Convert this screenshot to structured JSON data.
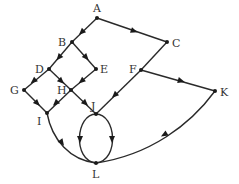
{
  "diagram": {
    "type": "directed-graph",
    "nodes": [
      {
        "id": "A",
        "label": "A",
        "x": 97,
        "y": 18,
        "lx": 93,
        "ly": 12
      },
      {
        "id": "B",
        "label": "B",
        "x": 72,
        "y": 42,
        "lx": 58,
        "ly": 46
      },
      {
        "id": "C",
        "label": "C",
        "x": 167,
        "y": 42,
        "lx": 172,
        "ly": 47
      },
      {
        "id": "D",
        "label": "D",
        "x": 49,
        "y": 69,
        "lx": 35,
        "ly": 73
      },
      {
        "id": "E",
        "label": "E",
        "x": 96,
        "y": 69,
        "lx": 100,
        "ly": 73
      },
      {
        "id": "F",
        "label": "F",
        "x": 141,
        "y": 70,
        "lx": 129,
        "ly": 73
      },
      {
        "id": "G",
        "label": "G",
        "x": 24,
        "y": 90,
        "lx": 10,
        "ly": 94
      },
      {
        "id": "H",
        "label": "H",
        "x": 71,
        "y": 90,
        "lx": 57,
        "ly": 94
      },
      {
        "id": "I",
        "label": "I",
        "x": 47,
        "y": 113,
        "lx": 37,
        "ly": 125
      },
      {
        "id": "J",
        "label": "J",
        "x": 96,
        "y": 114,
        "lx": 91,
        "ly": 110
      },
      {
        "id": "K",
        "label": "K",
        "x": 215,
        "y": 91,
        "lx": 220,
        "ly": 96
      },
      {
        "id": "L",
        "label": "L",
        "x": 96,
        "y": 163,
        "lx": 92,
        "ly": 178
      }
    ],
    "edges": [
      {
        "from": "A",
        "to": "B"
      },
      {
        "from": "A",
        "to": "C"
      },
      {
        "from": "B",
        "to": "D"
      },
      {
        "from": "B",
        "to": "E"
      },
      {
        "from": "D",
        "to": "G"
      },
      {
        "from": "D",
        "to": "H"
      },
      {
        "from": "E",
        "to": "H"
      },
      {
        "from": "G",
        "to": "I"
      },
      {
        "from": "H",
        "to": "I"
      },
      {
        "from": "H",
        "to": "J"
      },
      {
        "from": "C",
        "to": "F"
      },
      {
        "from": "F",
        "to": "J"
      },
      {
        "from": "F",
        "to": "K"
      },
      {
        "from": "J",
        "to": "L",
        "curve": "left-arc"
      },
      {
        "from": "J",
        "to": "L",
        "curve": "right-arc"
      },
      {
        "from": "I",
        "to": "L",
        "curve": "bowed"
      },
      {
        "from": "K",
        "to": "L",
        "curve": "bowed"
      }
    ]
  }
}
